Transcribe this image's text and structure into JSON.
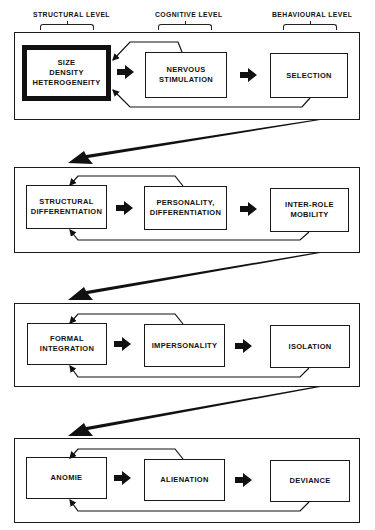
{
  "levels": [
    {
      "label": "STRUCTURAL LEVEL"
    },
    {
      "label": "COGNITIVE LEVEL"
    },
    {
      "label": "BEHAVIOURAL LEVEL"
    }
  ],
  "stages": [
    {
      "nodes": [
        {
          "label": "SIZE\nDENSITY\nHETEROGENEITY",
          "emphasized": true
        },
        {
          "label": "NERVOUS\nSTIMULATION"
        },
        {
          "label": "SELECTION"
        }
      ]
    },
    {
      "nodes": [
        {
          "label": "STRUCTURAL\nDIFFERENTIATION"
        },
        {
          "label": "PERSONALITY,\nDIFFERENTIATION"
        },
        {
          "label": "INTER-ROLE\nMOBILITY"
        }
      ]
    },
    {
      "nodes": [
        {
          "label": "FORMAL\nINTEGRATION"
        },
        {
          "label": "IMPERSONALITY"
        },
        {
          "label": "ISOLATION"
        }
      ]
    },
    {
      "nodes": [
        {
          "label": "ANOMIE"
        },
        {
          "label": "ALIENATION"
        },
        {
          "label": "DEVIANCE"
        }
      ]
    }
  ],
  "colors": {
    "ink": "#111111",
    "paper": "#ffffff"
  }
}
